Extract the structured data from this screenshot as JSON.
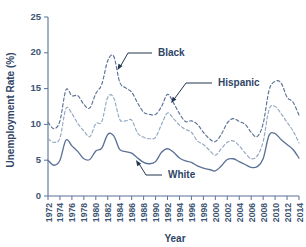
{
  "chart_data": {
    "type": "line",
    "title": "",
    "xlabel": "Year",
    "ylabel": "Unemployment Rate (%)",
    "xlim": [
      1972,
      2014
    ],
    "ylim": [
      0,
      25
    ],
    "yticks": [
      0,
      5,
      10,
      15,
      20,
      25
    ],
    "xticks": [
      1972,
      1974,
      1976,
      1978,
      1980,
      1982,
      1984,
      1986,
      1988,
      1990,
      1992,
      1994,
      1996,
      1998,
      2000,
      2002,
      2004,
      2006,
      2008,
      2010,
      2012,
      2014
    ],
    "grid": false,
    "legend_position": "inline-annotations",
    "x": [
      1972,
      1973,
      1974,
      1975,
      1976,
      1977,
      1978,
      1979,
      1980,
      1981,
      1982,
      1983,
      1984,
      1985,
      1986,
      1987,
      1988,
      1989,
      1990,
      1991,
      1992,
      1993,
      1994,
      1995,
      1996,
      1997,
      1998,
      1999,
      2000,
      2001,
      2002,
      2003,
      2004,
      2005,
      2006,
      2007,
      2008,
      2009,
      2010,
      2011,
      2012,
      2013,
      2014
    ],
    "series": [
      {
        "name": "Black",
        "style": "dashed",
        "color": "#5b7296",
        "values": [
          10.3,
          9.4,
          10.5,
          14.8,
          14.0,
          14.0,
          12.8,
          12.3,
          14.3,
          15.6,
          18.9,
          19.5,
          15.9,
          15.1,
          14.5,
          13.0,
          11.7,
          11.4,
          11.4,
          12.5,
          14.2,
          13.0,
          11.5,
          10.4,
          10.5,
          10.0,
          8.9,
          8.0,
          7.6,
          8.6,
          10.2,
          10.8,
          10.4,
          10.0,
          8.9,
          8.3,
          10.1,
          14.8,
          16.0,
          15.8,
          13.8,
          13.1,
          11.3
        ]
      },
      {
        "name": "Hispanic",
        "style": "dashed",
        "color": "#93a8c0",
        "values": [
          8.0,
          7.5,
          8.1,
          12.2,
          11.5,
          10.1,
          9.1,
          8.3,
          10.1,
          10.4,
          13.8,
          13.7,
          10.7,
          10.5,
          10.6,
          8.8,
          8.2,
          8.0,
          8.2,
          10.0,
          11.6,
          10.8,
          9.9,
          9.3,
          8.9,
          7.7,
          7.2,
          6.4,
          5.7,
          6.6,
          7.5,
          7.7,
          7.0,
          6.0,
          5.2,
          5.6,
          7.6,
          12.1,
          12.5,
          11.5,
          10.3,
          9.1,
          7.4
        ]
      },
      {
        "name": "White",
        "style": "solid",
        "color": "#5b7296",
        "values": [
          5.0,
          4.3,
          5.0,
          7.8,
          7.0,
          6.2,
          5.2,
          5.1,
          6.3,
          6.7,
          8.6,
          8.4,
          6.5,
          6.2,
          6.0,
          5.3,
          4.7,
          4.5,
          4.8,
          6.1,
          6.6,
          6.1,
          5.3,
          4.9,
          4.7,
          4.2,
          3.9,
          3.7,
          3.5,
          4.2,
          5.1,
          5.2,
          4.8,
          4.4,
          4.0,
          4.1,
          5.2,
          8.5,
          8.7,
          7.9,
          7.2,
          6.5,
          5.3
        ]
      }
    ],
    "annotations": [
      {
        "label": "Black",
        "target_year": 1984,
        "target_value": 15.9
      },
      {
        "label": "Hispanic",
        "target_year": 1992,
        "target_value": 11.6
      },
      {
        "label": "White",
        "target_year": 1989,
        "target_value": 4.5
      }
    ]
  },
  "axes": {
    "y_title": "Unemployment Rate (%)",
    "x_title": "Year"
  }
}
